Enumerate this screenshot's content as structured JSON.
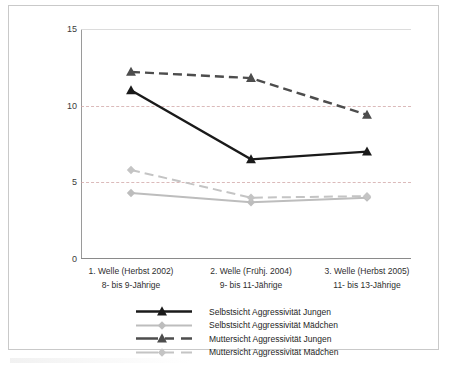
{
  "chart_data": {
    "type": "line",
    "title": "",
    "xlabel": "",
    "ylabel": "",
    "ylim": [
      0,
      15
    ],
    "yticks": [
      0,
      5,
      10,
      15
    ],
    "ytick_labels": [
      "0",
      "5",
      "10",
      "15"
    ],
    "grid": "horizontal dotted gridlines at 5 and 10",
    "legend_position": "below plot, centered",
    "categories": [
      "1. Welle (Herbst 2002)",
      "2. Welle (Frühj. 2004)",
      "3. Welle (Herbst 2005)"
    ],
    "category_sublabels": [
      "8- bis 9-Jährige",
      "9- bis 11-Jährige",
      "11- bis 13-Jährige"
    ],
    "series": [
      {
        "name": "Selbstsicht Aggressivität Jungen",
        "values": [
          11.0,
          6.5,
          7.0
        ],
        "color": "#1a1a1a",
        "style": "solid",
        "marker": "triangle"
      },
      {
        "name": "Selbstsicht Aggressivität Mädchen",
        "values": [
          4.3,
          3.7,
          4.0
        ],
        "color": "#bdbdbd",
        "style": "solid",
        "marker": "diamond"
      },
      {
        "name": "Muttersicht Aggressivität Jungen",
        "values": [
          12.2,
          11.8,
          9.4
        ],
        "color": "#4d4d4d",
        "style": "dashed",
        "marker": "triangle"
      },
      {
        "name": "Muttersicht Aggressivität Mädchen",
        "values": [
          5.8,
          4.0,
          4.1
        ],
        "color": "#c4c4c4",
        "style": "dashed",
        "marker": "diamond"
      }
    ]
  },
  "axis": {
    "ytick_0": "0",
    "ytick_5": "5",
    "ytick_10": "10",
    "ytick_15": "15"
  },
  "xaxis": {
    "labels": [
      {
        "line1": "1. Welle (Herbst 2002)",
        "line2": "8- bis 9-Jährige"
      },
      {
        "line1": "2. Welle (Frühj. 2004)",
        "line2": "9- bis 11-Jährige"
      },
      {
        "line1": "3. Welle (Herbst 2005)",
        "line2": "11- bis 13-Jährige"
      }
    ]
  },
  "legend": {
    "items": [
      {
        "label": "Selbstsicht Aggressivität Jungen"
      },
      {
        "label": "Selbstsicht Aggressivität Mädchen"
      },
      {
        "label": "Muttersicht Aggressivität Jungen"
      },
      {
        "label": "Muttersicht Aggressivität Mädchen"
      }
    ]
  }
}
